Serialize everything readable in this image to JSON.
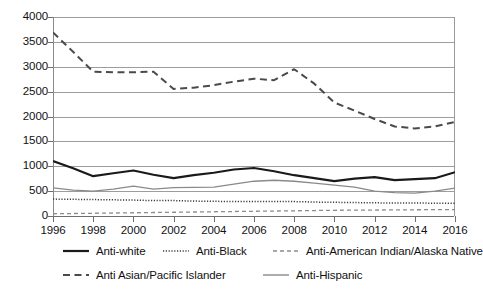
{
  "chart_data": {
    "type": "line",
    "title": "",
    "subtitle": "",
    "xlabel": "",
    "ylabel": "",
    "xlim": [
      1996,
      2016
    ],
    "ylim": [
      0,
      4000
    ],
    "grid": true,
    "legend_position": "bottom",
    "x": [
      1996,
      1997,
      1998,
      1999,
      2000,
      2001,
      2002,
      2003,
      2004,
      2005,
      2006,
      2007,
      2008,
      2009,
      2010,
      2011,
      2012,
      2013,
      2014,
      2015,
      2016
    ],
    "y_ticks": [
      0,
      500,
      1000,
      1500,
      2000,
      2500,
      3000,
      3500,
      4000
    ],
    "y_tick_labels": [
      "0",
      "500",
      "1000",
      "1500",
      "2000",
      "2500",
      "3000",
      "3500",
      "4000"
    ],
    "x_ticks": [
      1996,
      1998,
      2000,
      2002,
      2004,
      2006,
      2008,
      2010,
      2012,
      2014,
      2016
    ],
    "x_tick_labels": [
      "1996",
      "1998",
      "2000",
      "2002",
      "2004",
      "2006",
      "2008",
      "2010",
      "2012",
      "2014",
      "2016"
    ],
    "series": [
      {
        "name": "Anti-white",
        "style": "solid-thick",
        "color": "#1a1a1a",
        "values": [
          1106,
          960,
          800,
          860,
          915,
          830,
          760,
          820,
          870,
          935,
          965,
          900,
          820,
          760,
          700,
          750,
          780,
          720,
          740,
          760,
          880
        ]
      },
      {
        "name": "Anti-Black",
        "style": "dotted",
        "color": "#3c3c3c",
        "values": [
          340,
          335,
          330,
          325,
          320,
          310,
          310,
          300,
          295,
          290,
          290,
          290,
          290,
          280,
          275,
          270,
          265,
          260,
          260,
          258,
          255
        ]
      },
      {
        "name": "Anti-American Indian/Alaska Native",
        "style": "dashed-light",
        "color": "#8c8c8c",
        "values": [
          45,
          50,
          55,
          60,
          65,
          70,
          75,
          80,
          85,
          90,
          95,
          100,
          105,
          110,
          115,
          118,
          120,
          122,
          125,
          128,
          130
        ]
      },
      {
        "name": "Anti Asian/Pacific Islander",
        "style": "dashed-thick",
        "color": "#4a4a4a",
        "values": [
          3690,
          3300,
          2900,
          2890,
          2890,
          2900,
          2555,
          2580,
          2630,
          2700,
          2760,
          2730,
          2950,
          2660,
          2280,
          2120,
          1950,
          1800,
          1760,
          1800,
          1890
        ]
      },
      {
        "name": "Anti-Hispanic",
        "style": "solid-thin",
        "color": "#8a8a8a",
        "values": [
          565,
          520,
          500,
          540,
          600,
          540,
          570,
          575,
          580,
          640,
          700,
          720,
          700,
          660,
          620,
          580,
          500,
          470,
          460,
          500,
          560
        ]
      }
    ]
  },
  "legend": {
    "items": [
      {
        "label": "Anti-white",
        "style": "solid-thick",
        "color": "#1a1a1a"
      },
      {
        "label": "Anti-Black",
        "style": "dotted",
        "color": "#3c3c3c"
      },
      {
        "label": "Anti-American Indian/Alaska Native",
        "style": "dashed-light",
        "color": "#8c8c8c"
      },
      {
        "label": "Anti Asian/Pacific Islander",
        "style": "dashed-thick",
        "color": "#4a4a4a"
      },
      {
        "label": "Anti-Hispanic",
        "style": "solid-thin",
        "color": "#8a8a8a"
      }
    ],
    "positions": [
      {
        "left": 62,
        "top": 0
      },
      {
        "left": 162,
        "top": 0
      },
      {
        "left": 272,
        "top": 0
      },
      {
        "left": 62,
        "top": 24
      },
      {
        "left": 262,
        "top": 24
      }
    ]
  }
}
